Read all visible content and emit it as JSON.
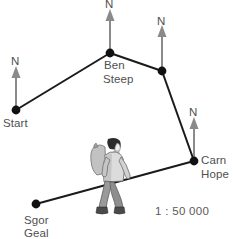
{
  "figure": {
    "type": "route-sketch-map",
    "width": 233,
    "height": 239,
    "scale_text": "1 : 50 000",
    "colors": {
      "route_line": "#1a1a1a",
      "vertex_dot": "#111111",
      "north_arrow": "#8a8a8a",
      "label_text": "#4f4f4f",
      "background": "#ffffff",
      "hiker_jacket": "#d8d8d8",
      "hiker_trousers": "#9a9a9a",
      "hiker_boots": "#4a4a4a",
      "hiker_hair": "#2b2b2b",
      "hiker_pack": "#c2c2c2"
    }
  },
  "points": [
    {
      "id": "start",
      "label": "Start",
      "x": 16,
      "y": 110,
      "label_x": 3,
      "label_y": 118
    },
    {
      "id": "ben-steep",
      "label": "Ben\nSteep",
      "x": 110,
      "y": 53,
      "label_x": 104,
      "label_y": 60
    },
    {
      "id": "junction",
      "label": "",
      "x": 162,
      "y": 71,
      "label_x": 0,
      "label_y": 0
    },
    {
      "id": "carn-hope",
      "label": "Carn\nHope",
      "x": 194,
      "y": 161,
      "label_x": 201,
      "label_y": 153
    },
    {
      "id": "sgor-geal",
      "label": "Sgor\nGeal",
      "x": 36,
      "y": 204,
      "label_x": 24,
      "label_y": 214
    }
  ],
  "point_labels": {
    "start": "Start",
    "ben_steep_line1": "Ben",
    "ben_steep_line2": "Steep",
    "carn_hope_line1": "Carn",
    "carn_hope_line2": "Hope",
    "sgor_geal_line1": "Sgor",
    "sgor_geal_line2": "Geal"
  },
  "north_arrows": [
    {
      "id": "north-start",
      "at_point": "start",
      "label": "N",
      "base_x": 16,
      "base_y": 110,
      "tip_y": 70,
      "label_x": 11,
      "label_y": 57
    },
    {
      "id": "north-ben-steep",
      "at_point": "ben-steep",
      "label": "N",
      "base_x": 110,
      "base_y": 53,
      "tip_y": 13,
      "label_x": 105,
      "label_y": 0
    },
    {
      "id": "north-junction",
      "at_point": "junction",
      "label": "N",
      "base_x": 162,
      "base_y": 71,
      "tip_y": 29,
      "label_x": 157,
      "label_y": 16
    },
    {
      "id": "north-carn-hope",
      "at_point": "carn-hope",
      "label": "N",
      "base_x": 194,
      "base_y": 161,
      "tip_y": 121,
      "label_x": 189,
      "label_y": 108
    }
  ],
  "route_legs": [
    {
      "from": "start",
      "to": "ben-steep"
    },
    {
      "from": "ben-steep",
      "to": "junction"
    },
    {
      "from": "junction",
      "to": "carn-hope"
    },
    {
      "from": "carn-hope",
      "to": "sgor-geal"
    }
  ],
  "hiker": {
    "name": "walking-hiker-figure",
    "x": 90,
    "y": 137,
    "width": 40,
    "height": 79
  },
  "scale": {
    "text": "1 : 50 000",
    "x": 155,
    "y": 205
  }
}
